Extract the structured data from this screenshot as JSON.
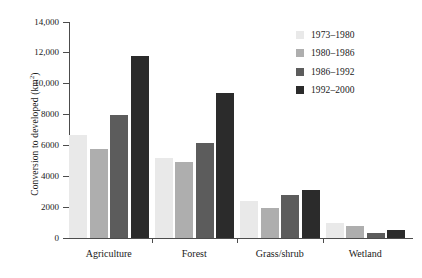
{
  "chart_data": {
    "type": "bar",
    "title": "",
    "xlabel": "",
    "ylabel": "Conversion to developed (km²)",
    "ylabel_main": "Conversion to developed (km",
    "ylabel_sup": "2",
    "ylabel_close": ")",
    "ylim": [
      0,
      14000
    ],
    "grid": false,
    "legend_position": "top-right",
    "categories": [
      "Agriculture",
      "Forest",
      "Grass/shrub",
      "Wetland"
    ],
    "ytick_labels": [
      "0",
      "2000",
      "4000",
      "6000",
      "8000",
      "10,000",
      "12,000",
      "14,000"
    ],
    "ytick_values": [
      0,
      2000,
      4000,
      6000,
      8000,
      10000,
      12000,
      14000
    ],
    "series": [
      {
        "name": "1973–1980",
        "color": "#e9e9e9",
        "values": [
          6700,
          5200,
          2400,
          1000
        ]
      },
      {
        "name": "1980–1986",
        "color": "#aeaeae",
        "values": [
          5800,
          4900,
          1950,
          750
        ]
      },
      {
        "name": "1986–1992",
        "color": "#5c5c5c",
        "values": [
          8000,
          6150,
          2800,
          350
        ]
      },
      {
        "name": "1992–2000",
        "color": "#2b2b2b",
        "values": [
          11800,
          9400,
          3100,
          550
        ]
      }
    ]
  }
}
